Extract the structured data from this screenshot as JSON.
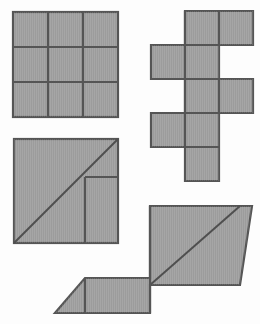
{
  "page": {
    "background_color": "#fdfdfd",
    "width": 260,
    "height": 324
  },
  "style": {
    "fill_color": "#9c9c9c",
    "stroke_color": "#555555",
    "diagonal_stroke_color": "#4f4f4f",
    "stroke_width": 2.2
  },
  "figures": [
    {
      "id": "figure-grid-3x3",
      "name": "three-by-three-square-grid",
      "description": "Large square subdivided into a 3 by 3 array of nine equal squares",
      "cell_count": 9,
      "rows": 3,
      "columns": 3,
      "bounds": {
        "x": 13,
        "y": 12,
        "width": 105,
        "height": 105
      },
      "cell_size": 35,
      "outline": [
        [
          13,
          12
        ],
        [
          118,
          12
        ],
        [
          118,
          117
        ],
        [
          13,
          117
        ]
      ],
      "interior_lines": [
        [
          [
            48,
            12
          ],
          [
            48,
            117
          ]
        ],
        [
          [
            83,
            12
          ],
          [
            83,
            117
          ]
        ],
        [
          [
            13,
            47
          ],
          [
            118,
            47
          ]
        ],
        [
          [
            13,
            82
          ],
          [
            118,
            82
          ]
        ]
      ]
    },
    {
      "id": "figure-cube-net",
      "name": "cube-net-hexomino",
      "description": "Staircase hexomino net made of six unit squares arranged in a zigzag column",
      "cell_count": 6,
      "cell_size": 34,
      "bounds": {
        "x": 151,
        "y": 11,
        "width": 102,
        "height": 170
      },
      "cells": [
        {
          "name": "net-cell-top-left",
          "x": 185,
          "y": 11,
          "w": 34,
          "h": 34
        },
        {
          "name": "net-cell-top-right",
          "x": 219,
          "y": 11,
          "w": 34,
          "h": 34
        },
        {
          "name": "net-cell-row2-left",
          "x": 151,
          "y": 45,
          "w": 34,
          "h": 34
        },
        {
          "name": "net-cell-row2-right",
          "x": 185,
          "y": 45,
          "w": 34,
          "h": 34
        },
        {
          "name": "net-cell-row3-left",
          "x": 185,
          "y": 79,
          "w": 34,
          "h": 34
        },
        {
          "name": "net-cell-row3-right",
          "x": 219,
          "y": 79,
          "w": 34,
          "h": 34
        },
        {
          "name": "net-cell-row4-left",
          "x": 151,
          "y": 113,
          "w": 34,
          "h": 34
        },
        {
          "name": "net-cell-row4-right",
          "x": 185,
          "y": 113,
          "w": 34,
          "h": 34
        },
        {
          "name": "net-cell-bottom",
          "x": 185,
          "y": 147,
          "w": 34,
          "h": 34
        }
      ],
      "outline": [
        [
          185,
          11
        ],
        [
          253,
          11
        ],
        [
          253,
          45
        ],
        [
          219,
          45
        ],
        [
          219,
          79
        ],
        [
          253,
          79
        ],
        [
          253,
          113
        ],
        [
          219,
          113
        ],
        [
          219,
          181
        ],
        [
          185,
          181
        ],
        [
          185,
          147
        ],
        [
          151,
          147
        ],
        [
          151,
          113
        ],
        [
          185,
          113
        ],
        [
          185,
          79
        ],
        [
          151,
          79
        ],
        [
          151,
          45
        ],
        [
          185,
          45
        ]
      ],
      "interior_lines": [
        [
          [
            219,
            11
          ],
          [
            219,
            45
          ]
        ],
        [
          [
            185,
            45
          ],
          [
            219,
            45
          ]
        ],
        [
          [
            185,
            11
          ],
          [
            185,
            45
          ]
        ],
        [
          [
            185,
            45
          ],
          [
            185,
            79
          ]
        ],
        [
          [
            151,
            79
          ],
          [
            219,
            79
          ]
        ],
        [
          [
            219,
            79
          ],
          [
            219,
            113
          ]
        ],
        [
          [
            185,
            79
          ],
          [
            185,
            113
          ]
        ],
        [
          [
            151,
            113
          ],
          [
            219,
            113
          ]
        ],
        [
          [
            185,
            113
          ],
          [
            185,
            147
          ]
        ],
        [
          [
            185,
            147
          ],
          [
            219,
            147
          ]
        ]
      ]
    },
    {
      "id": "figure-square-diagonal",
      "name": "square-with-diagonal-dissection",
      "description": "Square cut by a corner-to-corner diagonal with a small rectangular notch marked in the right portion",
      "bounds": {
        "x": 14,
        "y": 139,
        "width": 104,
        "height": 104
      },
      "outline": [
        [
          14,
          139
        ],
        [
          118,
          139
        ],
        [
          118,
          243
        ],
        [
          14,
          243
        ]
      ],
      "diagonal": [
        [
          14,
          243
        ],
        [
          118,
          139
        ]
      ],
      "interior_lines": [
        [
          [
            85,
            177
          ],
          [
            118,
            177
          ]
        ],
        [
          [
            85,
            177
          ],
          [
            85,
            243
          ]
        ]
      ]
    },
    {
      "id": "figure-zigzag-parallelogram",
      "name": "staircase-parallelogram-assembly",
      "description": "Large stepped polygon formed from a square with a diagonal plus a low parallelogram wing on the left",
      "bounds": {
        "x": 55,
        "y": 206,
        "width": 197,
        "height": 107
      },
      "outline": [
        [
          150,
          206
        ],
        [
          252,
          206
        ],
        [
          240,
          285
        ],
        [
          150,
          285
        ],
        [
          150,
          313
        ],
        [
          55,
          313
        ],
        [
          85,
          278
        ],
        [
          150,
          278
        ]
      ],
      "polygon_points": "150,206 252,206 240,285 150,285 150,313 55,313 85,278 150,278",
      "diagonal": [
        [
          150,
          285
        ],
        [
          240,
          206
        ]
      ],
      "interior_lines": [
        [
          [
            150,
            206
          ],
          [
            150,
            313
          ]
        ],
        [
          [
            85,
            278
          ],
          [
            85,
            313
          ]
        ]
      ]
    }
  ]
}
